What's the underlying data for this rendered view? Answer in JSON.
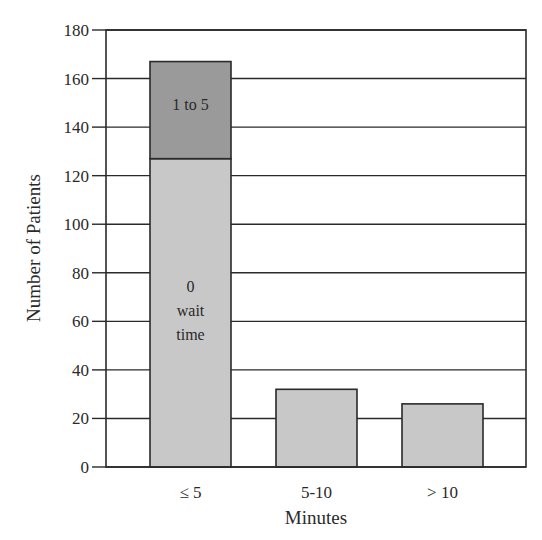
{
  "chart_data": {
    "type": "bar",
    "stacked": true,
    "title": "",
    "xlabel": "Minutes",
    "ylabel": "Number of Patients",
    "categories": [
      "≤ 5",
      "5-10",
      "> 10"
    ],
    "series": [
      {
        "name": "0 wait time",
        "values": [
          127,
          32,
          26
        ],
        "color": "#c8c8c8"
      },
      {
        "name": "1 to 5",
        "values": [
          40,
          0,
          0
        ],
        "color": "#9a9a9a"
      }
    ],
    "totals": [
      167,
      32,
      26
    ],
    "segment_labels": [
      {
        "category": "≤ 5",
        "series": "1 to 5",
        "text": "1 to 5"
      },
      {
        "category": "≤ 5",
        "series": "0 wait time",
        "lines": [
          "0",
          "wait",
          "time"
        ]
      }
    ],
    "ylim": [
      0,
      180
    ],
    "yticks": [
      0,
      20,
      40,
      60,
      80,
      100,
      120,
      140,
      160,
      180
    ],
    "grid": true,
    "legend": "none"
  }
}
